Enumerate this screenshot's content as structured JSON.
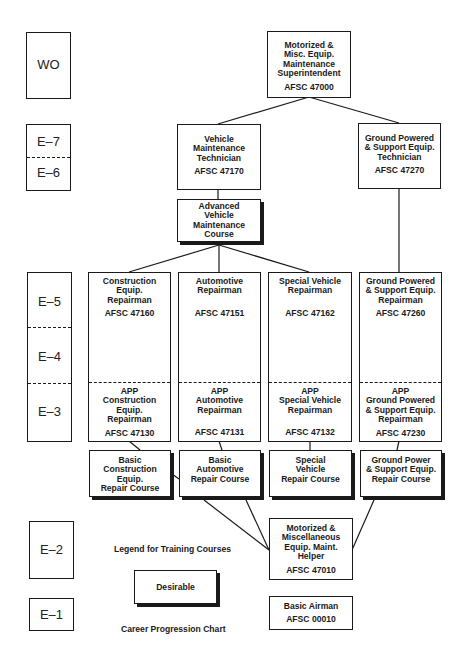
{
  "levels": {
    "wo": "WO",
    "e7": "E–7",
    "e6": "E–6",
    "e5": "E–5",
    "e4": "E–4",
    "e3": "E–3",
    "e2": "E–2",
    "e1": "E–1"
  },
  "positions": {
    "superintendent": {
      "title": "Motorized &\nMisc. Equip.\nMaintenance\nSuperintendent",
      "afsc": "AFSC 47000"
    },
    "vehicle_tech": {
      "title": "Vehicle\nMaintenance\nTechnician",
      "afsc": "AFSC 47170"
    },
    "ground_tech": {
      "title": "Ground Powered\n& Support Equip.\nTechnician",
      "afsc": "AFSC 47270"
    },
    "construction_repairman": {
      "title": "Construction\nEquip.\nRepairman",
      "afsc": "AFSC 47160"
    },
    "automotive_repairman": {
      "title": "Automotive\nRepairman",
      "afsc": "AFSC 47151"
    },
    "special_vehicle_repairman": {
      "title": "Special Vehicle\nRepairman",
      "afsc": "AFSC 47162"
    },
    "ground_repairman": {
      "title": "Ground Powered\n& Support Equip.\nRepairman",
      "afsc": "AFSC 47260"
    },
    "app_construction": {
      "title": "APP\nConstruction\nEquip.\nRepairman",
      "afsc": "AFSC 47130"
    },
    "app_automotive": {
      "title": "APP\nAutomotive\nRepairman",
      "afsc": "AFSC 47131"
    },
    "app_special_vehicle": {
      "title": "APP\nSpecial Vehicle\nRepairman",
      "afsc": "AFSC 47132"
    },
    "app_ground": {
      "title": "APP\nGround Powered\n& Support Equip.\nRepairman",
      "afsc": "AFSC 47230"
    },
    "helper": {
      "title": "Motorized &\nMiscellaneous\nEquip. Maint.\nHelper",
      "afsc": "AFSC 47010"
    },
    "basic_airman": {
      "title": "Basic Airman",
      "afsc": "AFSC 00010"
    }
  },
  "courses": {
    "advanced_vehicle": "Advanced\nVehicle\nMaintenance\nCourse",
    "basic_construction": "Basic\nConstruction\nEquip.\nRepair Course",
    "basic_automotive": "Basic\nAutomotive\nRepair Course",
    "special_vehicle": "Special\nVehicle\nRepair Course",
    "ground_power": "Ground Power\n& Support Equip.\nRepair Course"
  },
  "legend": {
    "title": "Legend for Training Courses",
    "desirable": "Desirable"
  },
  "caption": "Career Progression Chart"
}
